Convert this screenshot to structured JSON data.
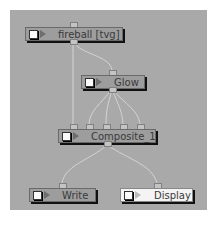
{
  "nodes": {
    "fireball": {
      "label": "fireball [tvg]"
    },
    "glow": {
      "label": "Glow"
    },
    "composite": {
      "label": "Composite_1"
    },
    "write": {
      "label": "Write"
    },
    "display": {
      "label": "Display"
    }
  },
  "colors": {
    "panel": "#a9a9a9",
    "node": "#9d9d9d",
    "display_node": "#f4f4f4",
    "wire": "#d8d8d8"
  }
}
